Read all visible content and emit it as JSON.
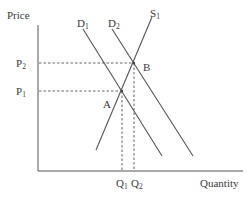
{
  "diagram": {
    "axes": {
      "y_label": "Price",
      "x_label": "Quantity"
    },
    "curves": [
      {
        "id": "D1",
        "label": "D",
        "subscript": "1",
        "type": "demand"
      },
      {
        "id": "D2",
        "label": "D",
        "subscript": "2",
        "type": "demand"
      },
      {
        "id": "S1",
        "label": "S",
        "subscript": "1",
        "type": "supply"
      }
    ],
    "points": [
      {
        "id": "A",
        "label": "A"
      },
      {
        "id": "B",
        "label": "B"
      }
    ],
    "price_levels": [
      {
        "label": "P",
        "subscript": "2"
      },
      {
        "label": "P",
        "subscript": "1"
      }
    ],
    "quantity_levels": [
      {
        "label": "Q",
        "subscript": "1"
      },
      {
        "label": "Q",
        "subscript": "2"
      }
    ],
    "colors": {
      "line": "#555555",
      "text": "#3a3a3a",
      "background": "#ffffff"
    }
  }
}
